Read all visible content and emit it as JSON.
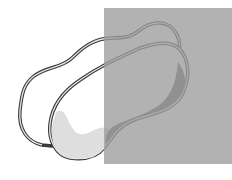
{
  "illustration": {
    "description": "Two overlapping outlined kidney-shaped blobs partially covered by a translucent gray rectangle",
    "colors": {
      "background": "#ffffff",
      "overlay": "#a9a9a9",
      "outline_dark": "#3a3a3a",
      "outline_light": "#9a9a9a",
      "fill_light": "#dedede",
      "fill_dark": "#6a6a6a"
    }
  }
}
